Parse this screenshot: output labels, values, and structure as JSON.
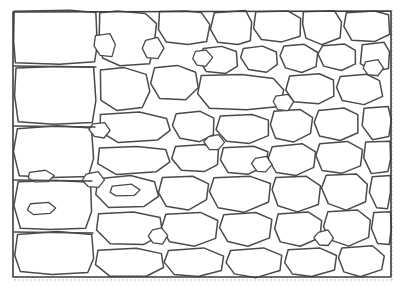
{
  "figure": {
    "title": "Rubble stone masonry wall",
    "style": "line-drawing",
    "medium": "pen-and-ink engraving",
    "caption": "",
    "width": 405,
    "height": 291
  },
  "colors": {
    "background": "#ffffff",
    "stone_fill": "#ffffff",
    "outline": "#4a4a4a",
    "border": "#3d3d3d",
    "faint_edge": "#bdbdbd"
  },
  "wall": {
    "left": 13,
    "top": 11,
    "right": 391,
    "bottom": 277,
    "stone_count": 118,
    "description": "Irregular polygonal rubble stones of varied size separated by dark mortar lines"
  },
  "stones": [
    {
      "id": "s001",
      "points": "14,12 70,11 96,12 97,46 94,62 60,64 16,63 14,40"
    },
    {
      "id": "s002",
      "points": "100,13 118,11 146,13 156,24 154,44 150,64 120,66 102,58 99,34"
    },
    {
      "id": "s003",
      "points": "159,12 186,11 201,13 210,24 207,42 188,45 166,42 158,30"
    },
    {
      "id": "s004",
      "points": "214,13 246,11 252,22 251,40 238,44 218,42 211,30"
    },
    {
      "id": "s005",
      "points": "256,12 288,11 300,18 300,36 282,42 262,40 254,28"
    },
    {
      "id": "s006",
      "points": "304,12 334,11 342,22 340,38 322,44 306,38 302,24"
    },
    {
      "id": "s007",
      "points": "346,13 374,11 388,14 390,34 374,42 352,40 344,26"
    },
    {
      "id": "s008",
      "points": "16,68 58,66 94,67 96,100 92,122 54,124 18,122 14,96"
    },
    {
      "id": "s009",
      "points": "100,70 124,68 146,74 150,92 142,108 116,110 101,100"
    },
    {
      "id": "s010",
      "points": "154,68 178,66 196,72 198,88 186,100 160,98 150,84"
    },
    {
      "id": "s011",
      "points": "203,48 222,46 236,52 238,66 226,74 206,72 200,60"
    },
    {
      "id": "s012",
      "points": "243,48 262,46 276,52 278,64 266,72 248,70 240,58"
    },
    {
      "id": "s013",
      "points": "284,46 304,44 318,52 316,66 302,72 286,68 280,56"
    },
    {
      "id": "s014",
      "points": "322,46 344,44 356,50 356,64 342,70 324,66 318,54"
    },
    {
      "id": "s015",
      "points": "362,44 384,43 390,52 389,68 374,72 360,64"
    },
    {
      "id": "s016",
      "points": "202,76 242,74 274,78 284,90 280,106 246,110 210,108 198,94"
    },
    {
      "id": "s017",
      "points": "290,76 320,74 334,80 334,96 318,104 294,102 286,90"
    },
    {
      "id": "s018",
      "points": "340,76 366,74 380,80 382,96 364,104 342,100 336,88"
    },
    {
      "id": "s019",
      "points": "18,128 58,126 92,128 94,158 88,176 52,178 20,176 14,152"
    },
    {
      "id": "s020",
      "points": "100,114 140,112 166,118 170,130 158,140 118,142 100,132"
    },
    {
      "id": "s021",
      "points": "100,148 136,146 166,150 170,162 156,172 116,174 98,164"
    },
    {
      "id": "s022",
      "points": "176,114 200,112 214,118 214,134 200,142 180,138 172,126"
    },
    {
      "id": "s023",
      "points": "220,116 252,114 268,120 268,136 250,144 226,142 216,130"
    },
    {
      "id": "s024",
      "points": "274,112 300,110 312,118 310,134 294,142 276,138 270,124"
    },
    {
      "id": "s025",
      "points": "318,110 344,108 358,114 358,132 340,140 320,136 314,122"
    },
    {
      "id": "s026",
      "points": "364,108 388,107 391,120 389,136 372,140 362,126"
    },
    {
      "id": "s027",
      "points": "176,146 204,144 218,150 218,164 204,172 182,170 172,158"
    },
    {
      "id": "s028",
      "points": "224,148 254,146 268,152 266,166 248,174 228,172 220,160"
    },
    {
      "id": "s029",
      "points": "272,146 302,144 316,152 314,168 296,176 276,172 268,158"
    },
    {
      "id": "s030",
      "points": "320,144 348,142 362,150 360,166 342,174 322,170 316,156"
    },
    {
      "id": "s031",
      "points": "366,142 390,141 391,158 388,172 372,174 364,158"
    },
    {
      "id": "s032",
      "points": "18,182 56,180 90,182 92,212 86,228 50,230 20,228 14,206"
    },
    {
      "id": "s033",
      "points": "98,178 130,176 154,182 158,196 144,206 108,208 96,194"
    },
    {
      "id": "s034",
      "points": "162,178 192,176 208,184 206,200 188,210 166,206 158,192"
    },
    {
      "id": "s035",
      "points": "214,178 250,176 270,184 268,202 244,212 218,208 210,192"
    },
    {
      "id": "s036",
      "points": "276,178 306,176 320,186 318,204 298,212 278,206 272,190"
    },
    {
      "id": "s037",
      "points": "326,176 356,174 368,184 366,202 346,210 328,204 322,188"
    },
    {
      "id": "s038",
      "points": "372,176 390,175 391,192 388,208 376,208 370,192"
    },
    {
      "id": "s039",
      "points": "98,214 134,212 160,218 162,234 144,244 110,244 96,230"
    },
    {
      "id": "s040",
      "points": "166,214 200,212 218,220 216,238 194,246 170,242 162,228"
    },
    {
      "id": "s041",
      "points": "224,214 256,212 272,220 270,238 248,246 228,242 220,228"
    },
    {
      "id": "s042",
      "points": "278,214 308,212 322,220 320,238 300,246 280,242 274,228"
    },
    {
      "id": "s043",
      "points": "328,212 358,210 370,220 368,238 348,246 330,240 324,226"
    },
    {
      "id": "s044",
      "points": "374,212 390,211 391,228 389,244 378,244 372,228"
    },
    {
      "id": "s045",
      "points": "18,234 58,232 92,234 94,258 88,272 52,274 20,272 14,256"
    },
    {
      "id": "s046",
      "points": "98,250 136,248 162,254 164,268 146,276 110,276 96,264"
    },
    {
      "id": "s047",
      "points": "168,250 204,248 224,256 222,270 198,277 174,274 164,262"
    },
    {
      "id": "s048",
      "points": "230,250 264,248 282,256 280,270 256,277 234,274 226,262"
    },
    {
      "id": "s049",
      "points": "288,250 320,248 336,256 334,270 312,277 292,274 284,262"
    },
    {
      "id": "s050",
      "points": "342,248 372,246 384,256 382,270 360,277 344,272 338,258"
    },
    {
      "id": "s051",
      "points": "96,36 110,34 116,44 112,56 100,56 94,46"
    },
    {
      "id": "s052",
      "points": "146,40 158,38 164,48 158,58 147,57 142,48"
    },
    {
      "id": "s053",
      "points": "196,52 206,50 212,58 206,66 197,65 192,58"
    },
    {
      "id": "s054",
      "points": "276,96 288,94 294,102 288,110 278,109 273,102"
    },
    {
      "id": "s055",
      "points": "208,136 218,134 224,142 218,150 209,149 204,142"
    },
    {
      "id": "s056",
      "points": "256,158 266,156 272,164 266,172 257,171 252,164"
    },
    {
      "id": "s057",
      "points": "152,230 162,228 168,236 162,244 153,243 148,236"
    },
    {
      "id": "s058",
      "points": "318,232 328,230 334,238 328,246 319,245 314,238"
    },
    {
      "id": "s059",
      "points": "92,124 104,122 110,130 104,138 94,137 89,130"
    },
    {
      "id": "s060",
      "points": "86,174 98,172 104,180 98,188 88,187 83,180"
    },
    {
      "id": "s061",
      "points": "366,62 378,60 384,68 378,76 368,75 363,68"
    },
    {
      "id": "s062",
      "points": "30,172 46,170 54,176 48,182 34,182 28,178"
    },
    {
      "id": "s063",
      "points": "30,204 48,202 56,208 50,214 34,214 28,210"
    },
    {
      "id": "s064",
      "points": "112,186 132,184 140,190 134,196 116,196 110,192"
    }
  ],
  "mortar_lines": [
    {
      "id": "m01",
      "d": "M14,66 L96,67"
    },
    {
      "id": "m02",
      "d": "M14,126 L95,127"
    },
    {
      "id": "m03",
      "d": "M14,180 L92,181"
    },
    {
      "id": "m04",
      "d": "M14,232 L93,233"
    }
  ],
  "annotations": {
    "has_text": false,
    "text_items": []
  },
  "accessibility": {
    "alt": "Black and white line drawing of a rubble stone masonry wall composed of irregular polygonal stones"
  }
}
